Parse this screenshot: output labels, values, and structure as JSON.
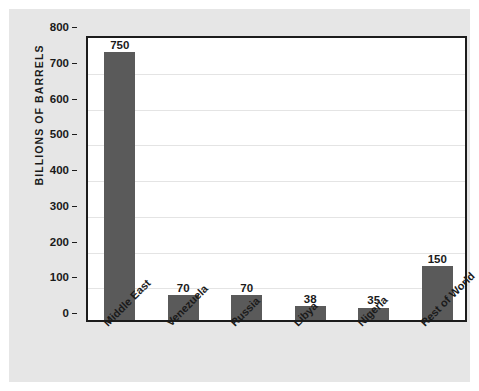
{
  "chart_data": {
    "type": "bar",
    "title": "",
    "subtitle": "",
    "xlabel": "",
    "ylabel": "BILLIONS OF BARRELS",
    "categories": [
      "Middle East",
      "Venezuela",
      "Russia",
      "Libya",
      "Nigeria",
      "Rest of World"
    ],
    "values": [
      750,
      70,
      70,
      38,
      35,
      150
    ],
    "value_labels": [
      "750",
      "70",
      "70",
      "38",
      "35",
      "150"
    ],
    "ylim": [
      0,
      800
    ],
    "ytick_labels": [
      "0",
      "100",
      "200",
      "300",
      "400",
      "500",
      "600",
      "700",
      "800"
    ],
    "ytick_values": [
      0,
      100,
      200,
      300,
      400,
      500,
      600,
      700,
      800
    ],
    "grid": true,
    "grid_axis": "y",
    "legend": false,
    "legend_position": "none",
    "bar_color": "#5a5a5a",
    "axis_color": "#1c1c1c",
    "gridline_color": "#e4e4e4",
    "plot_background": "#ffffff",
    "figure_background": "#e6e6e6",
    "xtick_rotation": -45
  }
}
